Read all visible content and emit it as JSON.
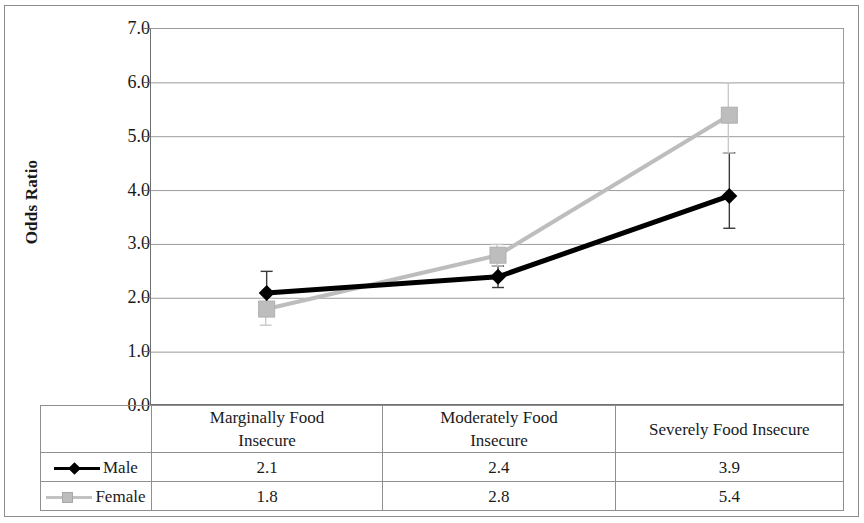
{
  "chart_data": {
    "type": "line",
    "title": "",
    "xlabel": "",
    "ylabel": "Odds Ratio",
    "ylim": [
      0.0,
      7.0
    ],
    "ytick_step": 1.0,
    "ytick_labels": [
      "7.0",
      "6.0",
      "5.0",
      "4.0",
      "3.0",
      "2.0",
      "1.0",
      "0.0"
    ],
    "grid": true,
    "legend_position": "bottom-table",
    "categories": [
      "Marginally Food Insecure",
      "Moderately Food Insecure",
      "Severely Food Insecure"
    ],
    "series": [
      {
        "name": "Male",
        "values": [
          2.1,
          2.4,
          3.9
        ],
        "color": "#000000",
        "marker": "diamond",
        "error_low": [
          1.8,
          2.2,
          3.3
        ],
        "error_high": [
          2.5,
          2.6,
          4.7
        ]
      },
      {
        "name": "Female",
        "values": [
          1.8,
          2.8,
          5.4
        ],
        "color": "#bdbdbd",
        "marker": "square",
        "error_low": [
          1.5,
          2.6,
          4.7
        ],
        "error_high": [
          2.0,
          3.0,
          6.0
        ]
      }
    ]
  },
  "table": {
    "column_headers": [
      "Marginally Food\nInsecure",
      "Moderately Food\nInsecure",
      "Severely Food Insecure"
    ],
    "column_headers_lines": [
      [
        "Marginally Food",
        "Insecure"
      ],
      [
        "Moderately Food",
        "Insecure"
      ],
      [
        "Severely Food Insecure"
      ]
    ],
    "rows": [
      {
        "label": "Male",
        "values": [
          "2.1",
          "2.4",
          "3.9"
        ]
      },
      {
        "label": "Female",
        "values": [
          "1.8",
          "2.8",
          "5.4"
        ]
      }
    ]
  },
  "axis": {
    "y_title": "Odds Ratio",
    "y_ticks": [
      "7.0",
      "6.0",
      "5.0",
      "4.0",
      "3.0",
      "2.0",
      "1.0",
      "0.0"
    ]
  },
  "colors": {
    "male": "#000000",
    "female": "#bdbdbd",
    "grid": "#9b9b9b",
    "frame": "#8c8c8c",
    "error_bar_male": "#3a3a3a",
    "error_bar_female": "#c9c9c9"
  }
}
